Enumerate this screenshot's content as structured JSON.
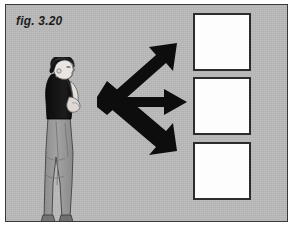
{
  "figure": {
    "label": "fig. 3.20",
    "background_color": "#b9b9b9",
    "border_color": "#3a3a3a",
    "ink_color": "#1d1d1d"
  },
  "person": {
    "name": "standing-person-profile",
    "description": "person standing in profile facing right, arms crossed",
    "hair_color": "#1a1a1a",
    "top_color": "#141414",
    "pants_color": "#9a9a9a",
    "skin_color": "#e8e4e0"
  },
  "arrows": {
    "color": "#0d0d0d",
    "count": 3,
    "items": [
      {
        "name": "arrow-up-right",
        "direction": "up-right"
      },
      {
        "name": "arrow-right",
        "direction": "right"
      },
      {
        "name": "arrow-down-right",
        "direction": "down-right"
      }
    ]
  },
  "boxes": {
    "count": 3,
    "fill_color": "#fdfdfd",
    "border_color": "#2c2c2c",
    "items": [
      {
        "name": "outcome-box-1",
        "content": ""
      },
      {
        "name": "outcome-box-2",
        "content": ""
      },
      {
        "name": "outcome-box-3",
        "content": ""
      }
    ]
  }
}
